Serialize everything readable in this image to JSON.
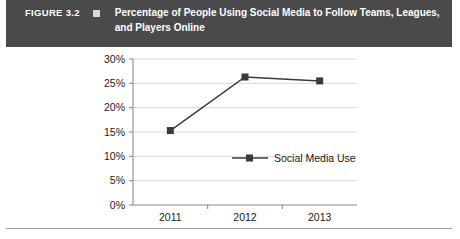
{
  "header": {
    "figure_number": "FIGURE 3.2",
    "bullet_icon": "square-bullet-icon",
    "title": "Percentage of People Using Social Media to Follow Teams, Leagues, and Players Online",
    "background_color": "#4a4a4a",
    "text_color": "#ffffff"
  },
  "chart_data": {
    "type": "line",
    "title": "",
    "xlabel": "",
    "ylabel": "",
    "categories": [
      "2011",
      "2012",
      "2013"
    ],
    "series": [
      {
        "name": "Social Media Use",
        "values": [
          15.3,
          26.3,
          25.5
        ],
        "color": "#3b3b3b",
        "marker": "square"
      }
    ],
    "ylim": [
      0,
      30
    ],
    "ytick_values": [
      0,
      5,
      10,
      15,
      20,
      25,
      30
    ],
    "ytick_labels": [
      "0%",
      "5%",
      "10%",
      "15%",
      "20%",
      "25%",
      "30%"
    ],
    "xtick_labels": [
      "2011",
      "2012",
      "2013"
    ],
    "grid": true,
    "grid_axis": "y",
    "grid_color": "#d9d9d9",
    "legend_position": "inside-center",
    "legend_entries": [
      "Social Media Use"
    ]
  },
  "footer": {
    "rule_color": "#9a9a9a"
  }
}
